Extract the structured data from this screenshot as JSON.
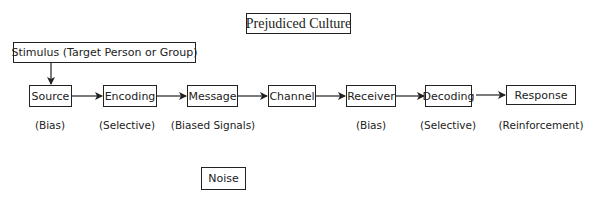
{
  "diagram": {
    "context": "Prejudiced Culture",
    "stimulus": "Stimulus (Target Person or Group)",
    "noise": "Noise",
    "nodes": [
      {
        "label": "Source",
        "annotation": "(Bias)"
      },
      {
        "label": "Encoding",
        "annotation": "(Selective)"
      },
      {
        "label": "Message",
        "annotation": "(Biased Signals)"
      },
      {
        "label": "Channel",
        "annotation": ""
      },
      {
        "label": "Receiver",
        "annotation": "(Bias)"
      },
      {
        "label": "Decoding",
        "annotation": "(Selective)"
      },
      {
        "label": "Response",
        "annotation": "(Reinforcement)"
      }
    ],
    "edges": [
      [
        "Stimulus (Target Person or Group)",
        "Source"
      ],
      [
        "Source",
        "Encoding"
      ],
      [
        "Encoding",
        "Message"
      ],
      [
        "Message",
        "Channel"
      ],
      [
        "Channel",
        "Receiver"
      ],
      [
        "Receiver",
        "Decoding"
      ],
      [
        "Decoding",
        "Response"
      ]
    ]
  }
}
